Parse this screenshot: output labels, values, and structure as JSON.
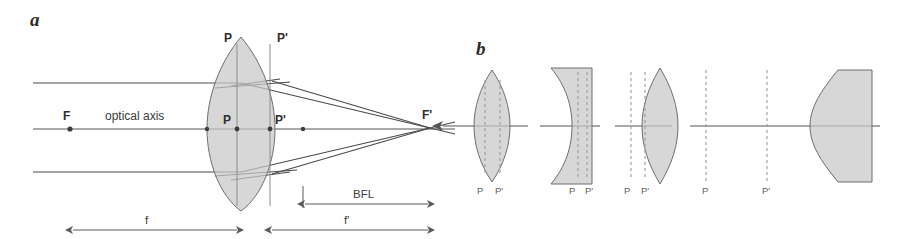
{
  "figure": {
    "title_panels": [
      "a",
      "b"
    ],
    "background_color": "#ffffff",
    "glass_color": "#c8c8c8",
    "line_color": "#4a4a4a"
  },
  "panel_a": {
    "letter": "a",
    "focal_point_left_label": "F",
    "focal_point_right_label": "F'",
    "axis_label": "optical axis",
    "principal_plane_top_left": "P",
    "principal_plane_top_right": "P'",
    "principal_point_left": "P",
    "principal_point_right": "P'",
    "dimension_front_focal": "f",
    "dimension_back_focal": "f'",
    "dimension_bfl": "BFL",
    "lens_type": "biconvex",
    "ray_count": 3
  },
  "panel_b": {
    "letter": "b",
    "elements": [
      {
        "name": "biconvex-lens",
        "label_left": "P",
        "label_right": "P'",
        "principal_planes_inside": true
      },
      {
        "name": "biconcave-meniscus-lens",
        "label_left": "P",
        "label_right": "P'",
        "principal_planes_inside": true
      },
      {
        "name": "meniscus-lens",
        "label_left": "P",
        "label_right": "P'",
        "principal_planes_inside": false
      },
      {
        "name": "thick-meniscus-lens",
        "label_left": "P",
        "label_right": "P'",
        "principal_planes_inside": false
      }
    ],
    "incoming-ray-direction": "leftward"
  }
}
